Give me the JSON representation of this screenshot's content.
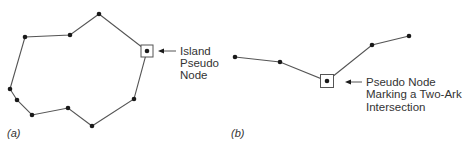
{
  "figure": {
    "panels": [
      {
        "id": "a",
        "caption": "(a)",
        "caption_pos": [
          7,
          137
        ],
        "type": "closed-polygon",
        "nodes": [
          [
            99,
            14
          ],
          [
            147,
            51
          ],
          [
            134,
            99
          ],
          [
            92,
            126
          ],
          [
            68,
            108
          ],
          [
            32,
            115
          ],
          [
            17,
            100
          ],
          [
            10,
            89
          ],
          [
            25,
            37
          ],
          [
            70,
            35
          ]
        ],
        "pseudo_node_box": {
          "center": [
            147,
            51
          ],
          "size": 12
        },
        "annotation": {
          "lines": [
            "Island",
            "Pseudo",
            "Node"
          ],
          "text_x": 180,
          "text_y": [
            55,
            67,
            79
          ],
          "arrow": {
            "from": [
              176,
              51
            ],
            "to": [
              158,
              51
            ]
          }
        }
      },
      {
        "id": "b",
        "caption": "(b)",
        "caption_pos": [
          231,
          137
        ],
        "type": "open-polyline",
        "nodes": [
          [
            235,
            57
          ],
          [
            280,
            62
          ],
          [
            327,
            81
          ],
          [
            372,
            45
          ],
          [
            409,
            36
          ]
        ],
        "pseudo_node_box": {
          "center": [
            327,
            81
          ],
          "size": 13
        },
        "annotation": {
          "lines": [
            "Pseudo Node",
            "Marking a Two-Ark",
            "Intersection"
          ],
          "text_x": 366,
          "text_y": [
            86,
            98,
            111
          ],
          "arrow": {
            "from": [
              362,
              82
            ],
            "to": [
              345,
              82
            ]
          }
        }
      }
    ],
    "colors": {
      "line": "#555555",
      "node": "#1a1a1a",
      "text": "#333333"
    }
  }
}
